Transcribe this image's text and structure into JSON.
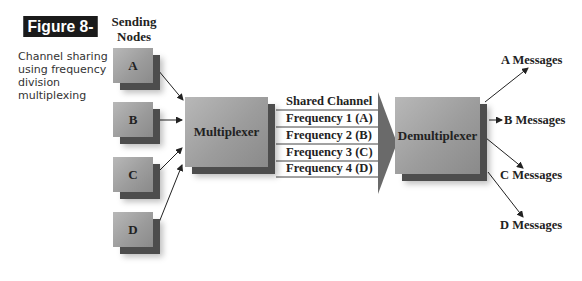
{
  "figure": {
    "badge": "Figure 8-20",
    "caption": "Channel sharing using frequency division multiplexing"
  },
  "sending_nodes": {
    "heading_line1": "Sending",
    "heading_line2": "Nodes",
    "nodes": [
      "A",
      "B",
      "C",
      "D"
    ]
  },
  "multiplexer": {
    "label": "Multiplexer"
  },
  "channel": {
    "title": "Shared Channel",
    "frequencies": [
      "Frequency 1 (A)",
      "Frequency 2 (B)",
      "Frequency 3 (C)",
      "Frequency 4 (D)"
    ]
  },
  "demultiplexer": {
    "label": "Demultiplexer"
  },
  "outputs": [
    "A Messages",
    "B Messages",
    "C Messages",
    "D Messages"
  ],
  "colors": {
    "badge_bg": "#1a1a1a",
    "box_face": "#a8a8a8",
    "box_depth": "#4d4d4d",
    "channel_arrow": "#6a6a6a"
  }
}
